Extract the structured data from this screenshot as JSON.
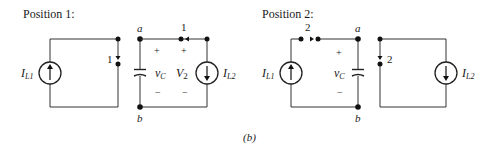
{
  "figure_label": "(b)",
  "panels": [
    {
      "title": "Position 1:",
      "switch_labels": [
        "1",
        "1"
      ],
      "nodes": [
        "a",
        "b"
      ],
      "sources": [
        {
          "name": "I",
          "sub": "L1",
          "direction": "up"
        },
        {
          "name": "I",
          "sub": "L2",
          "direction": "down"
        }
      ],
      "capacitor_voltage": {
        "name": "v",
        "sub": "C",
        "plus": "+",
        "minus": "−"
      },
      "source_voltage": {
        "name": "V",
        "sub": "2",
        "plus": "+",
        "minus": "−"
      }
    },
    {
      "title": "Position 2:",
      "switch_labels": [
        "2",
        "2"
      ],
      "nodes": [
        "a",
        "b"
      ],
      "sources": [
        {
          "name": "I",
          "sub": "L1",
          "direction": "up"
        },
        {
          "name": "I",
          "sub": "L2",
          "direction": "down"
        }
      ],
      "capacitor_voltage": {
        "name": "v",
        "sub": "C",
        "plus": "+",
        "minus": "−"
      }
    }
  ]
}
